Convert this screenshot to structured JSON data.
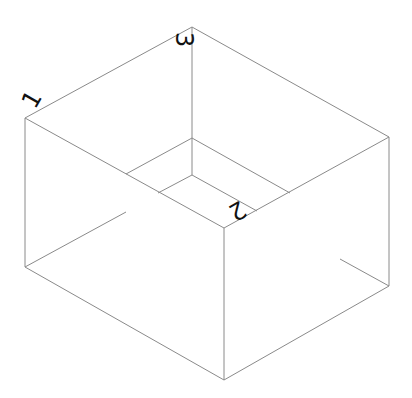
{
  "diagram": {
    "type": "isometric-box-wireframe",
    "line_color": "#8a8a8a",
    "label_color": "#111111",
    "background": "#ffffff",
    "vertices": {
      "top_back": [
        192,
        27
      ],
      "top_left": [
        25,
        118
      ],
      "top_right": [
        389,
        137
      ],
      "top_front": [
        224,
        228
      ],
      "bottom_front": [
        224,
        380
      ],
      "bottom_left": [
        25,
        267
      ],
      "bottom_right": [
        389,
        286
      ],
      "inner_back_upper": [
        192,
        138
      ],
      "inner_back_lower": [
        192,
        175
      ]
    },
    "labels": [
      {
        "id": "1",
        "text": "1",
        "x": 42,
        "y": 118,
        "rotate": -90
      },
      {
        "id": "2",
        "text": "2",
        "x": 224,
        "y": 213,
        "rotate": 180
      },
      {
        "id": "3",
        "text": "3",
        "x": 188,
        "y": 40,
        "rotate": 90
      }
    ]
  }
}
